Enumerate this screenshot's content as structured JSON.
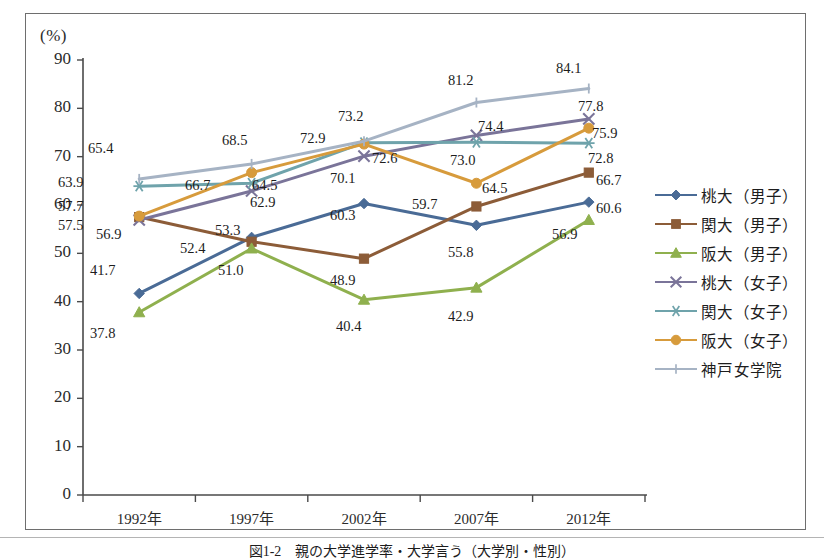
{
  "axis": {
    "unit_label": "(%)",
    "y_ticks": [
      "90",
      "80",
      "70",
      "60",
      "50",
      "40",
      "30",
      "20",
      "10",
      "0"
    ],
    "y_min": 0,
    "y_max": 90,
    "y_step": 10,
    "x_ticks": [
      "1992年",
      "1997年",
      "2002年",
      "2007年",
      "2012年"
    ]
  },
  "caption": {
    "text": "図1-2　親の大学進学率・大学言う（大学別・性別）"
  },
  "legend": {
    "items": [
      {
        "label": "桃大（男子）",
        "color": "#4a6b96",
        "marker": "diamond"
      },
      {
        "label": "関大（男子）",
        "color": "#8c5c38",
        "marker": "square"
      },
      {
        "label": "阪大（男子）",
        "color": "#8fb04e",
        "marker": "triangle"
      },
      {
        "label": "桃大（女子）",
        "color": "#7a7499",
        "marker": "x"
      },
      {
        "label": "関大（女子）",
        "color": "#6fa3ab",
        "marker": "asterisk"
      },
      {
        "label": "阪大（女子）",
        "color": "#d79b3c",
        "marker": "circle"
      },
      {
        "label": "神戸女学院",
        "color": "#a6b3c4",
        "marker": "bar"
      }
    ]
  },
  "chart_data": {
    "type": "line",
    "title": "",
    "xlabel": "",
    "ylabel": "(%)",
    "ylim": [
      0,
      90
    ],
    "ytick_step": 10,
    "grid": false,
    "legend_position": "right",
    "categories": [
      "1992年",
      "1997年",
      "2002年",
      "2007年",
      "2012年"
    ],
    "series": [
      {
        "name": "桃大（男子）",
        "color": "#4a6b96",
        "marker": "diamond",
        "values": [
          41.7,
          53.3,
          60.3,
          55.8,
          60.6
        ]
      },
      {
        "name": "関大（男子）",
        "color": "#8c5c38",
        "marker": "square",
        "values": [
          57.5,
          52.4,
          48.9,
          59.7,
          66.7
        ]
      },
      {
        "name": "阪大（男子）",
        "color": "#8fb04e",
        "marker": "triangle",
        "values": [
          37.8,
          51.0,
          40.4,
          42.9,
          56.9
        ]
      },
      {
        "name": "桃大（女子）",
        "color": "#7a7499",
        "marker": "x",
        "values": [
          56.9,
          62.9,
          70.1,
          74.4,
          77.8
        ]
      },
      {
        "name": "関大（女子）",
        "color": "#6fa3ab",
        "marker": "asterisk",
        "values": [
          63.9,
          64.5,
          72.9,
          73.0,
          72.8
        ]
      },
      {
        "name": "阪大（女子）",
        "color": "#d79b3c",
        "marker": "circle",
        "values": [
          57.7,
          66.7,
          72.6,
          64.5,
          75.9
        ]
      },
      {
        "name": "神戸女学院",
        "color": "#a6b3c4",
        "marker": "bar",
        "values": [
          65.4,
          68.5,
          73.2,
          81.2,
          84.1
        ]
      }
    ],
    "point_labels": [
      {
        "text": "65.4",
        "x": 88,
        "y": 140,
        "series": "神戸女学院",
        "value": 65.4
      },
      {
        "text": "63.9",
        "x": 58,
        "y": 174,
        "series": "関大（女子）",
        "value": 63.9
      },
      {
        "text": "57.7",
        "x": 58,
        "y": 198,
        "series": "阪大（女子）",
        "value": 57.7
      },
      {
        "text": "57.5",
        "x": 58,
        "y": 217,
        "series": "関大（男子）",
        "value": 57.5
      },
      {
        "text": "56.9",
        "x": 96,
        "y": 226,
        "series": "桃大（女子）",
        "value": 56.9
      },
      {
        "text": "41.7",
        "x": 90,
        "y": 262,
        "series": "桃大（男子）",
        "value": 41.7
      },
      {
        "text": "37.8",
        "x": 90,
        "y": 325,
        "series": "阪大（男子）",
        "value": 37.8
      },
      {
        "text": "68.5",
        "x": 222,
        "y": 132,
        "series": "神戸女学院",
        "value": 68.5
      },
      {
        "text": "66.7",
        "x": 185,
        "y": 177,
        "series": "阪大（女子）",
        "value": 66.7
      },
      {
        "text": "64.5",
        "x": 252,
        "y": 177,
        "series": "関大（女子）",
        "value": 64.5
      },
      {
        "text": "62.9",
        "x": 250,
        "y": 194,
        "series": "桃大（女子）",
        "value": 62.9
      },
      {
        "text": "53.3",
        "x": 215,
        "y": 222,
        "series": "桃大（男子）",
        "value": 53.3
      },
      {
        "text": "52.4",
        "x": 180,
        "y": 240,
        "series": "関大（男子）",
        "value": 52.4
      },
      {
        "text": "51.0",
        "x": 218,
        "y": 262,
        "series": "阪大（男子）",
        "value": 51.0
      },
      {
        "text": "73.2",
        "x": 338,
        "y": 108,
        "series": "神戸女学院",
        "value": 73.2
      },
      {
        "text": "72.9",
        "x": 300,
        "y": 130,
        "series": "関大（女子）",
        "value": 72.9
      },
      {
        "text": "72.6",
        "x": 372,
        "y": 150,
        "series": "阪大（女子）",
        "value": 72.6
      },
      {
        "text": "70.1",
        "x": 330,
        "y": 170,
        "series": "桃大（女子）",
        "value": 70.1
      },
      {
        "text": "60.3",
        "x": 330,
        "y": 207,
        "series": "桃大（男子）",
        "value": 60.3
      },
      {
        "text": "48.9",
        "x": 330,
        "y": 272,
        "series": "関大（男子）",
        "value": 48.9
      },
      {
        "text": "40.4",
        "x": 336,
        "y": 318,
        "series": "阪大（男子）",
        "value": 40.4
      },
      {
        "text": "81.2",
        "x": 448,
        "y": 72,
        "series": "神戸女学院",
        "value": 81.2
      },
      {
        "text": "74.4",
        "x": 478,
        "y": 118,
        "series": "桃大（女子）",
        "value": 74.4
      },
      {
        "text": "73.0",
        "x": 450,
        "y": 152,
        "series": "関大（女子）",
        "value": 73.0
      },
      {
        "text": "64.5",
        "x": 482,
        "y": 180,
        "series": "阪大（女子）",
        "value": 64.5
      },
      {
        "text": "59.7",
        "x": 412,
        "y": 196,
        "series": "関大（男子）",
        "value": 59.7
      },
      {
        "text": "55.8",
        "x": 448,
        "y": 244,
        "series": "桃大（男子）",
        "value": 55.8
      },
      {
        "text": "42.9",
        "x": 448,
        "y": 308,
        "series": "阪大（男子）",
        "value": 42.9
      },
      {
        "text": "84.1",
        "x": 556,
        "y": 60,
        "series": "神戸女学院",
        "value": 84.1
      },
      {
        "text": "77.8",
        "x": 578,
        "y": 98,
        "series": "桃大（女子）",
        "value": 77.8
      },
      {
        "text": "75.9",
        "x": 592,
        "y": 125,
        "series": "阪大（女子）",
        "value": 75.9
      },
      {
        "text": "72.8",
        "x": 588,
        "y": 150,
        "series": "関大（女子）",
        "value": 72.8
      },
      {
        "text": "66.7",
        "x": 596,
        "y": 172,
        "series": "関大（男子）",
        "value": 66.7
      },
      {
        "text": "60.6",
        "x": 596,
        "y": 200,
        "series": "桃大（男子）",
        "value": 60.6
      },
      {
        "text": "56.9",
        "x": 552,
        "y": 226,
        "series": "阪大（男子）",
        "value": 56.9
      }
    ]
  }
}
